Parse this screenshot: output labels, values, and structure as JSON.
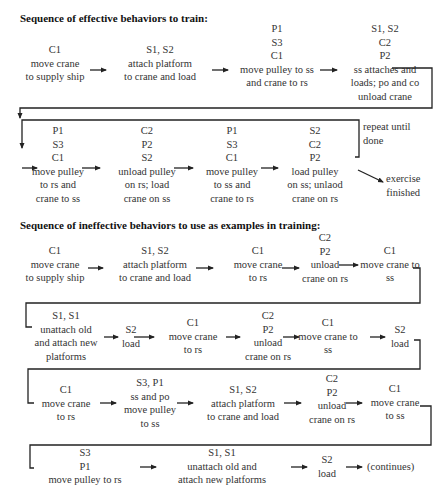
{
  "effective": {
    "heading": "Sequence of effective behaviors to train:",
    "row1": [
      {
        "actors": [
          "C1"
        ],
        "action": [
          "move crane",
          "to supply ship"
        ]
      },
      {
        "actors": [
          "S1, S2"
        ],
        "action": [
          "attach platform",
          "to crane and load"
        ]
      },
      {
        "actors": [
          "P1",
          "S3",
          "C1"
        ],
        "action": [
          "move pulley to ss",
          "and crane to rs"
        ]
      },
      {
        "actors": [
          "S1, S2",
          "C2",
          "P2"
        ],
        "action": [
          "ss attaches and",
          "loads; po and co",
          "unload crane"
        ]
      }
    ],
    "row2": [
      {
        "actors": [
          "P1",
          "S3",
          "C1"
        ],
        "action": [
          "move pulley",
          "to rs and",
          "crane to ss"
        ]
      },
      {
        "actors": [
          "C2",
          "P2",
          "S2"
        ],
        "action": [
          "unload pulley",
          "on rs; load",
          "crane on ss"
        ]
      },
      {
        "actors": [
          "P1",
          "S3",
          "C1"
        ],
        "action": [
          "move pulley",
          "to ss and",
          "crane to rs"
        ]
      },
      {
        "actors": [
          "S2",
          "C2",
          "P2"
        ],
        "action": [
          "load pulley",
          "on ss; unlaod",
          "crane on rs"
        ]
      }
    ],
    "repeat_note": [
      "repeat until",
      "done"
    ],
    "finish_note": [
      "exercise",
      "finished"
    ]
  },
  "ineffective": {
    "heading": "Sequence of ineffective behaviors to use as examples in training:",
    "row1": [
      {
        "actors": [
          "C1"
        ],
        "action": [
          "move crane",
          "to supply ship"
        ]
      },
      {
        "actors": [
          "S1, S2"
        ],
        "action": [
          "attach platform",
          "to crane and load"
        ]
      },
      {
        "actors": [
          "C1"
        ],
        "action": [
          "move crane",
          "to rs"
        ]
      },
      {
        "actors": [
          "C2",
          "P2"
        ],
        "action": [
          "unload",
          "crane on rs"
        ]
      },
      {
        "actors": [
          "C1"
        ],
        "action": [
          "move crane to",
          "ss"
        ]
      }
    ],
    "row2": [
      {
        "actors": [
          "S1, S1"
        ],
        "action": [
          "unattach old",
          "and attach new",
          "platforms"
        ]
      },
      {
        "actors": [
          "S2"
        ],
        "action": [
          "load"
        ]
      },
      {
        "actors": [
          "C1"
        ],
        "action": [
          "move crane",
          "to rs"
        ]
      },
      {
        "actors": [
          "C2",
          "P2"
        ],
        "action": [
          "unload",
          "crane on rs"
        ]
      },
      {
        "actors": [
          "C1"
        ],
        "action": [
          "move crane to",
          "ss"
        ]
      },
      {
        "actors": [
          "S2"
        ],
        "action": [
          "load"
        ]
      }
    ],
    "row3": [
      {
        "actors": [
          "C1"
        ],
        "action": [
          "move crane",
          "to rs"
        ]
      },
      {
        "actors": [
          "S3, P1"
        ],
        "action": [
          "ss and po",
          "move pulley",
          "to ss"
        ]
      },
      {
        "actors": [
          "S1, S2"
        ],
        "action": [
          "attach platform",
          "to crane and load"
        ]
      },
      {
        "actors": [
          "C2",
          "P2"
        ],
        "action": [
          "unload",
          "crane on rs"
        ]
      },
      {
        "actors": [
          "C1"
        ],
        "action": [
          "move crane",
          "to ss"
        ]
      }
    ],
    "row4": [
      {
        "actors": [
          "S3",
          "P1"
        ],
        "action": [
          "move pulley to rs"
        ]
      },
      {
        "actors": [
          "S1, S1"
        ],
        "action": [
          "unattach old and",
          "attach new platforms"
        ]
      },
      {
        "actors": [
          "S2"
        ],
        "action": [
          "load"
        ]
      }
    ],
    "continues_note": "(continues)"
  },
  "colors": {
    "text": "#333333",
    "heading": "#111111",
    "line": "#222222"
  }
}
